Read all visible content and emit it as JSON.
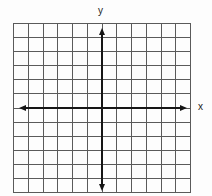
{
  "diagram": {
    "type": "coordinate-plane",
    "x_axis_label": "x",
    "y_axis_label": "y",
    "grid": {
      "columns": 12,
      "rows": 12,
      "left": 13,
      "top": 23,
      "right": 190,
      "bottom": 192,
      "line_color": "#5a5a5a",
      "line_width": 1
    },
    "axes": {
      "origin_x": 102,
      "origin_y": 108,
      "color": "#151515",
      "width": 2,
      "x_start": 19,
      "x_end": 187,
      "y_start": 28,
      "y_end": 191,
      "arrows": [
        "left",
        "right",
        "up",
        "down"
      ]
    },
    "background": "#fdfdfd"
  }
}
